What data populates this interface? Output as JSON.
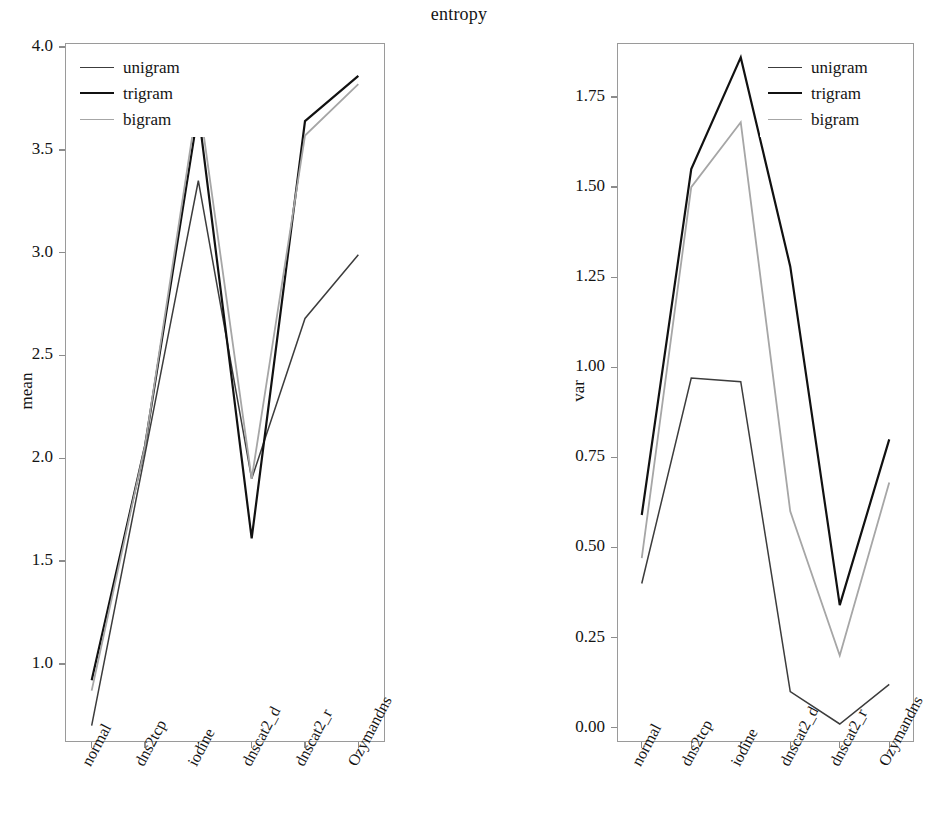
{
  "figure": {
    "title": "entropy",
    "background": "#ffffff"
  },
  "series_styles": {
    "unigram": {
      "color": "#3c3c3c",
      "width": 1.5
    },
    "trigram": {
      "color": "#111111",
      "width": 2.2
    },
    "bigram": {
      "color": "#a6a6a6",
      "width": 1.8
    }
  },
  "legend": {
    "position": "upper-left",
    "items": [
      {
        "label": "unigram",
        "key": "unigram"
      },
      {
        "label": "trigram",
        "key": "trigram"
      },
      {
        "label": "bigram",
        "key": "bigram"
      }
    ]
  },
  "legend_right": {
    "position": "upper-right",
    "items": [
      {
        "label": "unigram",
        "key": "unigram"
      },
      {
        "label": "trigram",
        "key": "trigram"
      },
      {
        "label": "bigram",
        "key": "bigram"
      }
    ]
  },
  "chart_data": [
    {
      "id": "mean-panel",
      "type": "line",
      "title": "entropy",
      "xlabel": "",
      "ylabel": "mean",
      "categories": [
        "normal",
        "dns2tcp",
        "iodine",
        "dnscat2_d",
        "dnscat2_r",
        "Ozymandns"
      ],
      "yticks": [
        1.0,
        1.5,
        2.0,
        2.5,
        3.0,
        3.5,
        4.0
      ],
      "ytick_labels": [
        "1.0",
        "1.5",
        "2.0",
        "2.5",
        "3.0",
        "3.5",
        "4.0"
      ],
      "ylim": [
        0.62,
        4.02
      ],
      "grid": false,
      "legend_position": "upper left",
      "series": [
        {
          "name": "unigram",
          "values": [
            0.7,
            2.02,
            3.35,
            1.9,
            2.68,
            2.99
          ]
        },
        {
          "name": "trigram",
          "values": [
            0.92,
            2.06,
            3.69,
            1.61,
            3.64,
            3.86
          ]
        },
        {
          "name": "bigram",
          "values": [
            0.87,
            2.06,
            3.76,
            1.9,
            3.57,
            3.82
          ]
        }
      ]
    },
    {
      "id": "var-panel",
      "type": "line",
      "title": "entropy",
      "xlabel": "",
      "ylabel": "var",
      "categories": [
        "normal",
        "dns2tcp",
        "iodine",
        "dnscat2_d",
        "dnscat2_r",
        "Ozymandns"
      ],
      "yticks": [
        0.0,
        0.25,
        0.5,
        0.75,
        1.0,
        1.25,
        1.5,
        1.75
      ],
      "ytick_labels": [
        "0.00",
        "0.25",
        "0.50",
        "0.75",
        "1.00",
        "1.25",
        "1.50",
        "1.75"
      ],
      "ylim": [
        -0.04,
        1.9
      ],
      "grid": false,
      "legend_position": "upper right",
      "series": [
        {
          "name": "unigram",
          "values": [
            0.4,
            0.97,
            0.96,
            0.1,
            0.01,
            0.12
          ]
        },
        {
          "name": "trigram",
          "values": [
            0.59,
            1.55,
            1.86,
            1.28,
            0.34,
            0.8
          ]
        },
        {
          "name": "bigram",
          "values": [
            0.47,
            1.5,
            1.68,
            0.6,
            0.2,
            0.68
          ]
        }
      ]
    }
  ]
}
